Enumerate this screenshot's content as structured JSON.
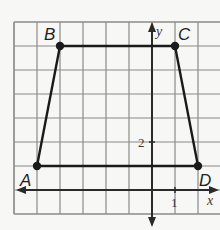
{
  "figure": {
    "grid": {
      "x_min": -6,
      "x_max": 3,
      "y_min": -1,
      "y_max": 7,
      "grid_color": "#8a8a8a",
      "axis_color": "#2a2a2a"
    },
    "axes": {
      "x_label": "x",
      "y_label": "y",
      "x_tick_label": "1",
      "y_tick_label": "2"
    },
    "points": [
      {
        "name": "A",
        "x": -5,
        "y": 1
      },
      {
        "name": "B",
        "x": -4,
        "y": 6
      },
      {
        "name": "C",
        "x": 1,
        "y": 6
      },
      {
        "name": "D",
        "x": 2,
        "y": 1
      }
    ],
    "shape_color": "#1a1a1a"
  }
}
